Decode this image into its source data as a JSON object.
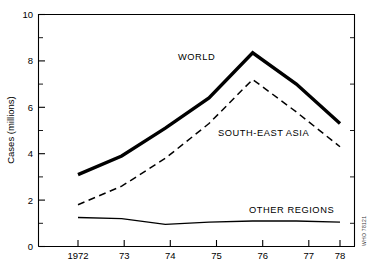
{
  "chart_data": {
    "type": "line",
    "title": "",
    "xlabel": "",
    "ylabel": "Cases (millions)",
    "x": [
      1972,
      1973,
      1974,
      1975,
      1976,
      1977,
      1978
    ],
    "xtick_labels": [
      "1972",
      "73",
      "74",
      "75",
      "76",
      "77",
      "78"
    ],
    "ytick_labels": [
      "0",
      "2",
      "4",
      "6",
      "8",
      "10"
    ],
    "ytick_values": [
      0,
      2,
      4,
      6,
      8,
      10
    ],
    "yminor_values": [
      1,
      3,
      5,
      7,
      9
    ],
    "xlim": [
      1972,
      1978
    ],
    "ylim": [
      0,
      10
    ],
    "grid": false,
    "legend_position": "inline-annotations",
    "series": [
      {
        "name": "WORLD",
        "style": "solid-thick",
        "values": [
          3.1,
          3.9,
          5.1,
          6.4,
          8.35,
          7.0,
          5.3
        ]
      },
      {
        "name": "SOUTH-EAST ASIA",
        "style": "dashed",
        "values": [
          1.8,
          2.6,
          3.8,
          5.3,
          7.2,
          5.8,
          4.3
        ]
      },
      {
        "name": "OTHER REGIONS",
        "style": "solid-thin",
        "values": [
          1.25,
          1.2,
          0.95,
          1.05,
          1.1,
          1.1,
          1.05
        ]
      }
    ],
    "annotations": [
      {
        "text": "WORLD",
        "x_px": 178,
        "y_px": 60
      },
      {
        "text": "SOUTH-EAST ASIA",
        "x_px": 218,
        "y_px": 136
      },
      {
        "text": "OTHER REGIONS",
        "x_px": 249,
        "y_px": 213
      }
    ]
  },
  "credit": {
    "text": "WHO 78121"
  },
  "topstrip": {
    "text": ""
  }
}
